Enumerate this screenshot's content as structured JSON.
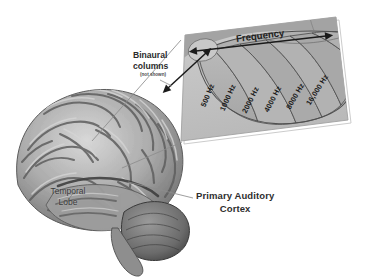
{
  "figure": {
    "title_present": false,
    "type": "anatomical-diagram"
  },
  "brain": {
    "temporal_lobe_label": "Temporal\nLobe",
    "temporal_lobe_line1": "Temporal",
    "temporal_lobe_line2": "Lobe"
  },
  "callout": {
    "pac_line1": "Primary Auditory",
    "pac_line2": "Cortex"
  },
  "inset": {
    "binaural_line1": "Binaural",
    "binaural_line2": "columns",
    "binaural_note": "(not shown)",
    "frequency_axis_label": "Frequency"
  },
  "chart_data": {
    "type": "heatmap",
    "xlabel": "Frequency",
    "ylabel": "",
    "categories": [
      "500 Hz",
      "1000 Hz",
      "2000 Hz",
      "4000 Hz",
      "8000 Hz",
      "16,000 Hz"
    ],
    "values": [
      500,
      1000,
      2000,
      4000,
      8000,
      16000
    ],
    "units": "Hz",
    "axis_direction": "low-to-high left-to-right",
    "legend": [],
    "grid": false,
    "annotations": [
      "Frequency",
      "Binaural columns",
      "(not shown)"
    ]
  },
  "colors": {
    "panel_light": "#c9c9c9",
    "panel_mid": "#aeaeae",
    "panel_dark": "#9a9a9a",
    "band_fill": "#b4b4b4",
    "band_stroke": "#5a5a5a",
    "text": "#2b2b2b",
    "background": "#ffffff"
  }
}
